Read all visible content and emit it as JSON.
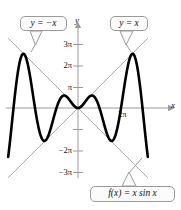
{
  "chart_data": {
    "type": "line",
    "title": "",
    "xlabel": "x",
    "ylabel": "y",
    "function_label": "f(x) = x sin x",
    "xlim": [
      -10.2,
      10.2
    ],
    "ylim": [
      -10.9,
      10.9
    ],
    "grid": false,
    "legend": "none",
    "axis_color": "#9a9a9a",
    "curve_color": "#000000",
    "envelope_color": "#a8a8a8",
    "y_ticks": [
      {
        "value": 9.4248,
        "label": "3π"
      },
      {
        "value": 6.2832,
        "label": "2π"
      },
      {
        "value": 3.1416,
        "label": "π"
      },
      {
        "value": -3.1416,
        "label": ""
      },
      {
        "value": -6.2832,
        "label": "−2π"
      },
      {
        "value": -9.4248,
        "label": "−3π"
      }
    ],
    "x_ticks": [
      {
        "value": 6.2832,
        "label": "2π"
      }
    ],
    "series": [
      {
        "name": "f(x) = x sin x",
        "style": "thick-black",
        "x": [
          -10.2,
          -9.9,
          -9.6,
          -9.3,
          -9.0,
          -8.7,
          -8.4,
          -8.1,
          -7.8,
          -7.5,
          -7.2,
          -6.9,
          -6.6,
          -6.3,
          -6.0,
          -5.7,
          -5.4,
          -5.1,
          -4.8,
          -4.5,
          -4.2,
          -3.9,
          -3.6,
          -3.3,
          -3.0,
          -2.7,
          -2.4,
          -2.1,
          -1.8,
          -1.5,
          -1.2,
          -0.9,
          -0.6,
          -0.3,
          0.0,
          0.3,
          0.6,
          0.9,
          1.2,
          1.5,
          1.8,
          2.1,
          2.4,
          2.7,
          3.0,
          3.3,
          3.6,
          3.9,
          4.2,
          4.5,
          4.8,
          5.1,
          5.4,
          5.7,
          6.0,
          6.3,
          6.6,
          6.9,
          7.2,
          7.5,
          7.8,
          8.1,
          8.4,
          8.7,
          9.0,
          9.3,
          9.6,
          9.9,
          10.2
        ],
        "y": [
          8.32,
          4.56,
          0.21,
          -4.12,
          -3.71,
          -6.38,
          -7.57,
          -8.05,
          -7.79,
          -6.8,
          -5.18,
          -4.05,
          -2.04,
          0.13,
          1.68,
          3.19,
          4.19,
          4.73,
          4.78,
          4.4,
          3.66,
          2.68,
          1.6,
          0.54,
          -0.42,
          -1.16,
          -1.62,
          -1.81,
          -1.75,
          -1.5,
          -1.12,
          -0.71,
          -0.34,
          -0.09,
          0.0,
          0.09,
          0.34,
          0.71,
          1.12,
          1.5,
          1.75,
          1.81,
          1.62,
          1.16,
          0.42,
          -0.54,
          -1.6,
          -2.68,
          -3.66,
          -4.4,
          -4.78,
          -4.73,
          -4.19,
          -3.19,
          -1.68,
          -0.13,
          2.04,
          4.05,
          5.18,
          6.8,
          7.79,
          8.05,
          7.57,
          6.38,
          3.71,
          4.12,
          -0.21,
          -4.56,
          -8.32
        ]
      },
      {
        "name": "y = x",
        "style": "thin-gray",
        "x": [
          -10.2,
          10.2
        ],
        "y": [
          -10.2,
          10.2
        ]
      },
      {
        "name": "y = -x",
        "style": "thin-gray",
        "x": [
          -10.2,
          10.2
        ],
        "y": [
          10.2,
          -10.2
        ]
      }
    ],
    "annotations": [
      {
        "name": "callout-neg-x",
        "text": "y = −x",
        "points_to": "upper-left envelope line"
      },
      {
        "name": "callout-pos-x",
        "text": "y = x",
        "points_to": "upper-right envelope line"
      },
      {
        "name": "callout-fx",
        "text": "f(x) = x sin x",
        "points_to": "lower-right branch of curve"
      }
    ]
  },
  "labels": {
    "y_axis": "y",
    "x_axis": "x",
    "y_tick_3pi": "3π",
    "y_tick_2pi": "2π",
    "y_tick_pi": "π",
    "y_tick_neg2pi": "−2π",
    "y_tick_neg3pi": "−3π",
    "x_tick_2pi": "2π",
    "callout_neg_x": "y = −x",
    "callout_pos_x": "y = x",
    "callout_fx": "f(x) = x sin x"
  }
}
